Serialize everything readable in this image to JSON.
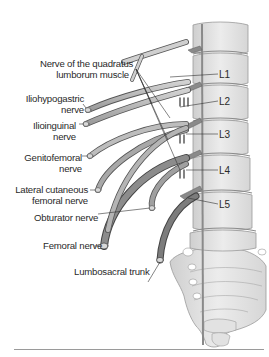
{
  "figure": {
    "colors": {
      "nerve_light": "#bdbdbd",
      "nerve_dark": "#7c7c7c",
      "nerve_outline": "#555555",
      "bone_fill": "#e6e6e6",
      "bone_outline": "#9a9a9a",
      "leader_line": "#333333",
      "text": "#2a2a2a"
    },
    "labels_left": [
      {
        "id": "quadratus",
        "line1": "Nerve of the quadratus",
        "line2": "lumborum muscle"
      },
      {
        "id": "iliohypogastric",
        "line1": "Iliohypogastric",
        "line2": "nerve"
      },
      {
        "id": "ilioinguinal",
        "line1": "Ilioinguinal",
        "line2": "nerve"
      },
      {
        "id": "genitofemoral",
        "line1": "Genitofemoral",
        "line2": "nerve"
      },
      {
        "id": "lateral_cutaneous",
        "line1": "Lateral cutaneous",
        "line2": "femoral nerve"
      },
      {
        "id": "obturator",
        "line1": "Obturator nerve"
      },
      {
        "id": "femoral",
        "line1": "Femoral nerve"
      },
      {
        "id": "lumbosacral",
        "line1": "Lumbosacral trunk"
      }
    ],
    "vertebra_labels": [
      "L1",
      "L2",
      "L3",
      "L4",
      "L5"
    ]
  }
}
